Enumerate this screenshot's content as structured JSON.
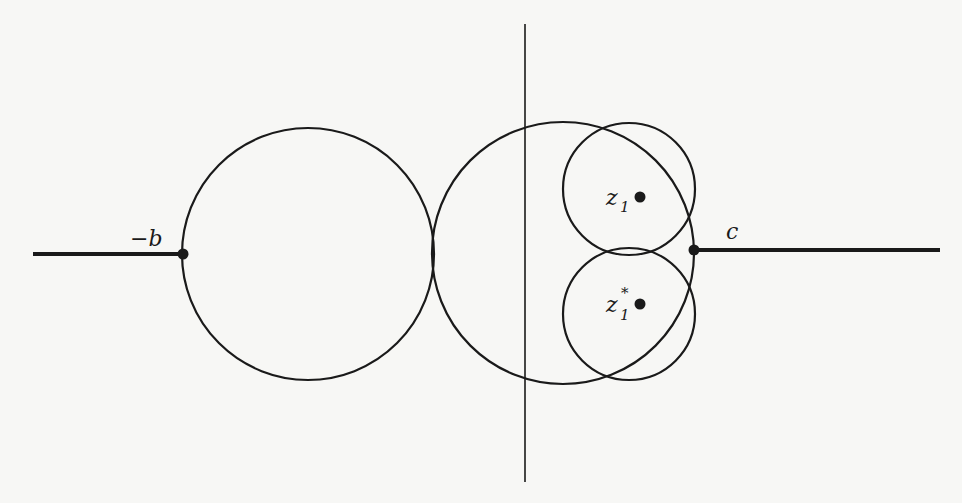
{
  "diagram": {
    "labels": {
      "neg_b": "−b",
      "c": "c",
      "z1": "z",
      "z1_sub": "1",
      "z1star": "z",
      "z1star_sub": "1",
      "z1star_sup": "*"
    },
    "colors": {
      "stroke": "#1a1a1a",
      "background": "#f7f7f5"
    },
    "elements": {
      "vertical_axis": {
        "x": 525,
        "y1": 24,
        "y2": 482
      },
      "left_cut": {
        "x1": 33,
        "x2": 183,
        "y": 254
      },
      "right_cut": {
        "x1": 694,
        "x2": 940,
        "y": 250
      },
      "circles": [
        {
          "name": "left-circle",
          "cx": 308,
          "cy": 254,
          "r": 126
        },
        {
          "name": "middle-circle",
          "cx": 563,
          "cy": 253,
          "r": 131
        },
        {
          "name": "upper-small-circle",
          "cx": 629,
          "cy": 189,
          "r": 66
        },
        {
          "name": "lower-small-circle",
          "cx": 629,
          "cy": 314,
          "r": 66
        }
      ],
      "points": [
        {
          "name": "point-neg-b",
          "x": 183,
          "y": 254
        },
        {
          "name": "point-c",
          "x": 694,
          "y": 250
        },
        {
          "name": "point-z1",
          "x": 640,
          "y": 197
        },
        {
          "name": "point-z1-star",
          "x": 640,
          "y": 304
        }
      ]
    }
  }
}
